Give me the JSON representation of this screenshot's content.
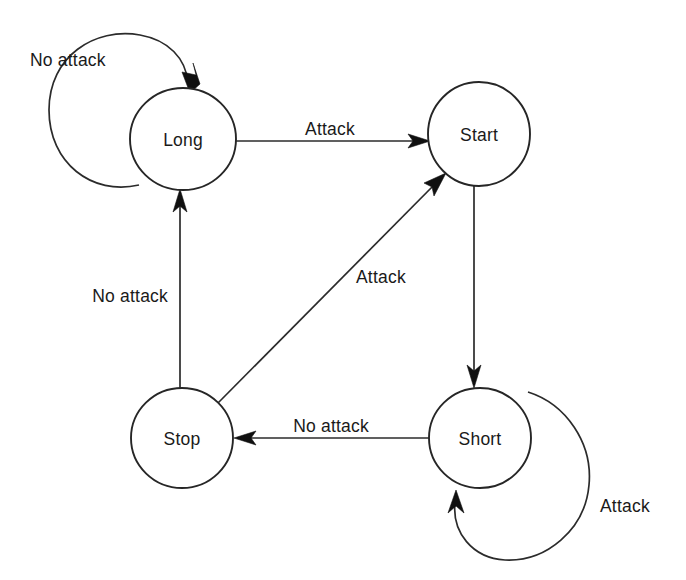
{
  "diagram": {
    "type": "state-transition-diagram",
    "title": "",
    "canvas": {
      "width": 686,
      "height": 580
    },
    "colors": {
      "background": "#ffffff",
      "stroke": "#2b2b2b",
      "node_stroke": "#262626",
      "node_fill": "#ffffff",
      "text": "#1a1a1a",
      "arrow_fill": "#101010"
    },
    "nodes": [
      {
        "id": "long",
        "label": "Long",
        "cx": 183,
        "cy": 139,
        "rx": 53,
        "ry": 51
      },
      {
        "id": "start",
        "label": "Start",
        "cx": 479,
        "cy": 134,
        "rx": 51,
        "ry": 52
      },
      {
        "id": "stop",
        "label": "Stop",
        "cx": 182,
        "cy": 438,
        "rx": 51,
        "ry": 50
      },
      {
        "id": "short",
        "label": "Short",
        "cx": 480,
        "cy": 438,
        "rx": 51,
        "ry": 50
      }
    ],
    "edges": [
      {
        "id": "long-self",
        "from": "long",
        "to": "long",
        "label": "No attack",
        "kind": "self-loop",
        "label_x": 30,
        "label_y": 60,
        "label_anchor": "start"
      },
      {
        "id": "long-to-start",
        "from": "long",
        "to": "start",
        "label": "Attack",
        "kind": "straight",
        "label_x": 330,
        "label_y": 129,
        "label_anchor": "middle"
      },
      {
        "id": "stop-to-long",
        "from": "stop",
        "to": "long",
        "label": "No attack",
        "kind": "straight",
        "label_x": 168,
        "label_y": 296,
        "label_anchor": "end"
      },
      {
        "id": "stop-to-start",
        "from": "stop",
        "to": "start",
        "label": "Attack",
        "kind": "straight",
        "label_x": 356,
        "label_y": 277,
        "label_anchor": "start"
      },
      {
        "id": "start-to-short",
        "from": "start",
        "to": "short",
        "label": "",
        "kind": "straight",
        "label_x": 0,
        "label_y": 0,
        "label_anchor": "middle"
      },
      {
        "id": "short-to-stop",
        "from": "short",
        "to": "stop",
        "label": "No attack",
        "kind": "straight",
        "label_x": 331,
        "label_y": 426,
        "label_anchor": "middle"
      },
      {
        "id": "short-self",
        "from": "short",
        "to": "short",
        "label": "Attack",
        "kind": "self-loop",
        "label_x": 600,
        "label_y": 506,
        "label_anchor": "start"
      }
    ]
  }
}
